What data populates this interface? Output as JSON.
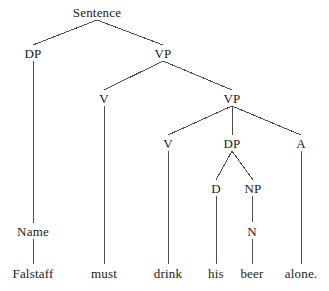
{
  "figure": {
    "type": "syntax-tree",
    "sentence": "Falstaff must drink his beer alone.",
    "background_color": "#ffffff",
    "line_color": "#4d4d4d",
    "text_color": "#1a1a1a",
    "width": 329,
    "height": 291
  },
  "nodes": [
    {
      "id": "sentence",
      "label": "Sentence",
      "x": 97,
      "y": 12,
      "level": 0
    },
    {
      "id": "dp1",
      "label": "DP",
      "x": 33,
      "y": 53,
      "level": 1
    },
    {
      "id": "vp1",
      "label": "VP",
      "x": 163,
      "y": 53,
      "level": 1
    },
    {
      "id": "v1",
      "label": "V",
      "x": 104,
      "y": 98,
      "level": 2
    },
    {
      "id": "vp2",
      "label": "VP",
      "x": 232,
      "y": 98,
      "level": 2
    },
    {
      "id": "v2",
      "label": "V",
      "x": 168,
      "y": 143,
      "level": 3
    },
    {
      "id": "dp2",
      "label": "DP",
      "x": 232,
      "y": 143,
      "level": 3
    },
    {
      "id": "a1",
      "label": "A",
      "x": 301,
      "y": 143,
      "level": 3
    },
    {
      "id": "d1",
      "label": "D",
      "x": 216,
      "y": 188,
      "level": 4
    },
    {
      "id": "np1",
      "label": "NP",
      "x": 253,
      "y": 188,
      "level": 4
    },
    {
      "id": "n1",
      "label": "N",
      "x": 252,
      "y": 231,
      "level": 5
    },
    {
      "id": "name1",
      "label": "Name",
      "x": 33,
      "y": 231,
      "level": 5
    }
  ],
  "terminals": [
    {
      "id": "falstaff",
      "label": "Falstaff",
      "x": 33,
      "y": 273
    },
    {
      "id": "must",
      "label": "must",
      "x": 104,
      "y": 273
    },
    {
      "id": "drink",
      "label": "drink",
      "x": 168,
      "y": 273
    },
    {
      "id": "his",
      "label": "his",
      "x": 216,
      "y": 273
    },
    {
      "id": "beer",
      "label": "beer",
      "x": 252,
      "y": 273
    },
    {
      "id": "alone",
      "label": "alone.",
      "x": 301,
      "y": 273
    }
  ],
  "edges": [
    {
      "id": "sentence-dp1",
      "from": "sentence",
      "to": "dp1",
      "x1": 97,
      "y1": 20,
      "x2": 33,
      "y2": 45
    },
    {
      "id": "sentence-vp1",
      "from": "sentence",
      "to": "vp1",
      "x1": 97,
      "y1": 20,
      "x2": 163,
      "y2": 45
    },
    {
      "id": "dp1-name1",
      "from": "dp1",
      "to": "name1",
      "x1": 33,
      "y1": 61,
      "x2": 33,
      "y2": 223
    },
    {
      "id": "vp1-v1",
      "from": "vp1",
      "to": "v1",
      "x1": 163,
      "y1": 61,
      "x2": 104,
      "y2": 90
    },
    {
      "id": "vp1-vp2",
      "from": "vp1",
      "to": "vp2",
      "x1": 163,
      "y1": 61,
      "x2": 232,
      "y2": 90
    },
    {
      "id": "v1-must",
      "from": "v1",
      "to": "must",
      "x1": 104,
      "y1": 106,
      "x2": 104,
      "y2": 264
    },
    {
      "id": "vp2-v2",
      "from": "vp2",
      "to": "v2",
      "x1": 232,
      "y1": 106,
      "x2": 168,
      "y2": 135
    },
    {
      "id": "vp2-dp2",
      "from": "vp2",
      "to": "dp2",
      "x1": 232,
      "y1": 106,
      "x2": 232,
      "y2": 135
    },
    {
      "id": "vp2-a1",
      "from": "vp2",
      "to": "a1",
      "x1": 232,
      "y1": 106,
      "x2": 301,
      "y2": 135
    },
    {
      "id": "v2-drink",
      "from": "v2",
      "to": "drink",
      "x1": 168,
      "y1": 151,
      "x2": 168,
      "y2": 264
    },
    {
      "id": "dp2-d1",
      "from": "dp2",
      "to": "d1",
      "x1": 232,
      "y1": 151,
      "x2": 216,
      "y2": 180
    },
    {
      "id": "dp2-np1",
      "from": "dp2",
      "to": "np1",
      "x1": 232,
      "y1": 151,
      "x2": 253,
      "y2": 180
    },
    {
      "id": "d1-his",
      "from": "d1",
      "to": "his",
      "x1": 216,
      "y1": 196,
      "x2": 216,
      "y2": 264
    },
    {
      "id": "np1-n1",
      "from": "np1",
      "to": "n1",
      "x1": 253,
      "y1": 196,
      "x2": 252,
      "y2": 223
    },
    {
      "id": "n1-beer",
      "from": "n1",
      "to": "beer",
      "x1": 252,
      "y1": 239,
      "x2": 252,
      "y2": 264
    },
    {
      "id": "a1-alone",
      "from": "a1",
      "to": "alone",
      "x1": 301,
      "y1": 151,
      "x2": 301,
      "y2": 264
    },
    {
      "id": "name1-falstaff",
      "from": "name1",
      "to": "falstaff",
      "x1": 33,
      "y1": 239,
      "x2": 33,
      "y2": 264
    }
  ]
}
